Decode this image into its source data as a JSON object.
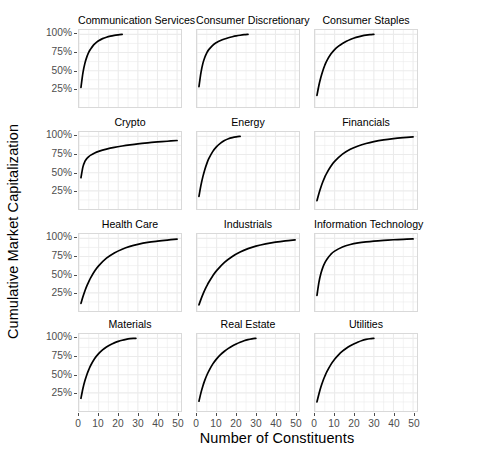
{
  "chart_data": {
    "type": "line",
    "title": "",
    "xlabel": "Number of Constituents",
    "ylabel": "Cumulative Market Capitalization",
    "layout": {
      "rows": 4,
      "cols": 3,
      "grid": true,
      "legend": "none",
      "shared_axes": true
    },
    "xlim": [
      0,
      52
    ],
    "ylim": [
      0,
      1.06
    ],
    "xticks": [
      0,
      10,
      20,
      30,
      40,
      50
    ],
    "xticklabels": [
      "0",
      "10",
      "20",
      "30",
      "40",
      "50"
    ],
    "yticks": [
      0.25,
      0.5,
      0.75,
      1.0
    ],
    "yticklabels": [
      "25%",
      "50%",
      "75%",
      "100%"
    ],
    "line_color": "#000000",
    "grid_color": "#ebebeb",
    "panel_border_color": "#d9d9d9",
    "panels": [
      {
        "name": "Communication Services",
        "row": 0,
        "col": 0,
        "x": [
          1,
          2,
          3,
          4,
          5,
          6,
          7,
          8,
          9,
          10,
          12,
          14,
          16,
          18,
          20,
          22
        ],
        "y": [
          0.27,
          0.47,
          0.6,
          0.69,
          0.755,
          0.8,
          0.838,
          0.868,
          0.892,
          0.912,
          0.941,
          0.961,
          0.975,
          0.985,
          0.993,
          1.0
        ]
      },
      {
        "name": "Consumer Discretionary",
        "row": 0,
        "col": 1,
        "x": [
          1,
          2,
          3,
          4,
          5,
          6,
          8,
          10,
          12,
          14,
          16,
          18,
          20,
          22,
          24,
          26
        ],
        "y": [
          0.28,
          0.47,
          0.6,
          0.685,
          0.745,
          0.79,
          0.85,
          0.888,
          0.915,
          0.936,
          0.953,
          0.967,
          0.979,
          0.988,
          0.995,
          1.0
        ]
      },
      {
        "name": "Consumer Staples",
        "row": 0,
        "col": 2,
        "x": [
          1,
          2,
          3,
          4,
          5,
          6,
          8,
          10,
          12,
          14,
          16,
          18,
          20,
          22,
          24,
          26,
          28,
          30
        ],
        "y": [
          0.16,
          0.3,
          0.41,
          0.5,
          0.575,
          0.635,
          0.725,
          0.79,
          0.838,
          0.875,
          0.905,
          0.93,
          0.95,
          0.966,
          0.979,
          0.989,
          0.996,
          1.0
        ]
      },
      {
        "name": "Crypto",
        "row": 1,
        "col": 0,
        "x": [
          1,
          2,
          3,
          4,
          5,
          6,
          8,
          10,
          14,
          18,
          22,
          26,
          30,
          35,
          40,
          45,
          50
        ],
        "y": [
          0.43,
          0.58,
          0.655,
          0.695,
          0.722,
          0.742,
          0.772,
          0.793,
          0.824,
          0.848,
          0.867,
          0.883,
          0.897,
          0.911,
          0.923,
          0.933,
          0.943
        ]
      },
      {
        "name": "Energy",
        "row": 1,
        "col": 1,
        "x": [
          1,
          2,
          3,
          4,
          5,
          6,
          8,
          10,
          12,
          14,
          16,
          18,
          20,
          22
        ],
        "y": [
          0.175,
          0.325,
          0.445,
          0.545,
          0.625,
          0.692,
          0.79,
          0.858,
          0.906,
          0.942,
          0.967,
          0.983,
          0.994,
          1.0
        ]
      },
      {
        "name": "Financials",
        "row": 1,
        "col": 2,
        "x": [
          1,
          2,
          3,
          4,
          5,
          6,
          8,
          10,
          14,
          18,
          22,
          26,
          30,
          35,
          40,
          45,
          50
        ],
        "y": [
          0.115,
          0.215,
          0.3,
          0.375,
          0.44,
          0.495,
          0.585,
          0.655,
          0.755,
          0.822,
          0.868,
          0.902,
          0.928,
          0.952,
          0.969,
          0.982,
          0.993
        ]
      },
      {
        "name": "Health Care",
        "row": 2,
        "col": 0,
        "x": [
          1,
          2,
          3,
          4,
          5,
          6,
          8,
          10,
          14,
          18,
          22,
          26,
          30,
          35,
          40,
          45,
          50
        ],
        "y": [
          0.105,
          0.195,
          0.275,
          0.345,
          0.405,
          0.46,
          0.55,
          0.622,
          0.727,
          0.799,
          0.851,
          0.889,
          0.917,
          0.944,
          0.962,
          0.977,
          0.99
        ]
      },
      {
        "name": "Industrials",
        "row": 2,
        "col": 1,
        "x": [
          1,
          2,
          3,
          4,
          5,
          6,
          8,
          10,
          14,
          18,
          22,
          26,
          30,
          35,
          40,
          45,
          50
        ],
        "y": [
          0.085,
          0.16,
          0.228,
          0.29,
          0.345,
          0.396,
          0.483,
          0.556,
          0.669,
          0.751,
          0.812,
          0.858,
          0.893,
          0.925,
          0.948,
          0.966,
          0.98
        ]
      },
      {
        "name": "Information Technology",
        "row": 2,
        "col": 2,
        "x": [
          1,
          2,
          3,
          4,
          5,
          6,
          8,
          10,
          14,
          18,
          22,
          26,
          30,
          35,
          40,
          45,
          50
        ],
        "y": [
          0.215,
          0.395,
          0.515,
          0.6,
          0.662,
          0.71,
          0.778,
          0.824,
          0.881,
          0.915,
          0.937,
          0.952,
          0.963,
          0.973,
          0.981,
          0.987,
          0.992
        ]
      },
      {
        "name": "Materials",
        "row": 3,
        "col": 0,
        "x": [
          1,
          2,
          3,
          4,
          5,
          6,
          8,
          10,
          12,
          14,
          16,
          18,
          20,
          22,
          24,
          26,
          28,
          29
        ],
        "y": [
          0.175,
          0.31,
          0.415,
          0.5,
          0.57,
          0.63,
          0.722,
          0.79,
          0.841,
          0.881,
          0.912,
          0.938,
          0.958,
          0.974,
          0.986,
          0.995,
          0.999,
          1.0
        ]
      },
      {
        "name": "Real Estate",
        "row": 3,
        "col": 1,
        "x": [
          1,
          2,
          3,
          4,
          5,
          6,
          8,
          10,
          12,
          14,
          16,
          18,
          20,
          22,
          24,
          26,
          28,
          30
        ],
        "y": [
          0.135,
          0.25,
          0.345,
          0.425,
          0.492,
          0.55,
          0.645,
          0.718,
          0.776,
          0.823,
          0.862,
          0.895,
          0.923,
          0.947,
          0.967,
          0.982,
          0.993,
          1.0
        ]
      },
      {
        "name": "Utilities",
        "row": 3,
        "col": 2,
        "x": [
          1,
          2,
          3,
          4,
          5,
          6,
          8,
          10,
          12,
          14,
          16,
          18,
          20,
          22,
          24,
          26,
          28,
          30
        ],
        "y": [
          0.125,
          0.235,
          0.33,
          0.41,
          0.478,
          0.538,
          0.635,
          0.712,
          0.773,
          0.823,
          0.864,
          0.898,
          0.927,
          0.951,
          0.971,
          0.985,
          0.995,
          1.0
        ]
      }
    ]
  }
}
